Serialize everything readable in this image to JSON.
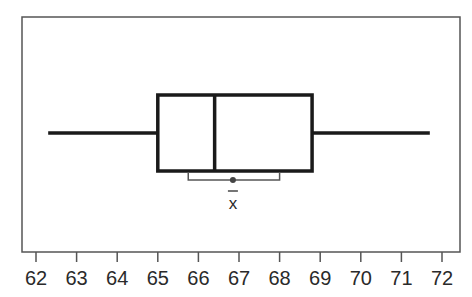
{
  "chart_data": {
    "type": "boxplot",
    "title": "",
    "xlabel": "",
    "ylabel": "",
    "xlim": [
      61.65,
      72.4
    ],
    "ticks": [
      62,
      63,
      64,
      65,
      66,
      67,
      68,
      69,
      70,
      71,
      72
    ],
    "tick_labels": [
      "62",
      "63",
      "64",
      "65",
      "66",
      "67",
      "68",
      "69",
      "70",
      "71",
      "72"
    ],
    "grid": false,
    "legend": null,
    "box": {
      "min": 62.3,
      "q1": 65.0,
      "median": 66.4,
      "q3": 68.8,
      "max": 71.7
    },
    "mean": 66.85,
    "mean_label": "x̄",
    "mean_interval": [
      65.75,
      68.0
    ],
    "colors": {
      "box": "#1a1a1a",
      "frame": "#555555",
      "interval": "#555555",
      "mean_dot": "#444444",
      "text": "#2a2a2a"
    }
  }
}
